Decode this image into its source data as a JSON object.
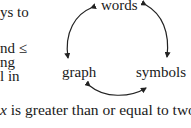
{
  "left_fragment": {
    "lines": [
      {
        "text": "ys to",
        "top": 5
      },
      {
        "text": "nd ≤",
        "top": 41
      },
      {
        "text": "ng",
        "top": 55
      },
      {
        "text": "l in",
        "top": 69
      }
    ]
  },
  "diagram": {
    "type": "cycle",
    "nodes": {
      "top": "words",
      "bottom_left": "graph",
      "bottom_right": "symbols"
    },
    "arrows": [
      {
        "from": "words",
        "to": "graph",
        "bidirectional": true
      },
      {
        "from": "words",
        "to": "symbols",
        "bidirectional": true
      },
      {
        "from": "graph",
        "to": "symbols",
        "bidirectional": true
      }
    ],
    "stroke_color": "#222222"
  },
  "caption": {
    "variable": "x",
    "rest": " is greater than or equal to two."
  }
}
